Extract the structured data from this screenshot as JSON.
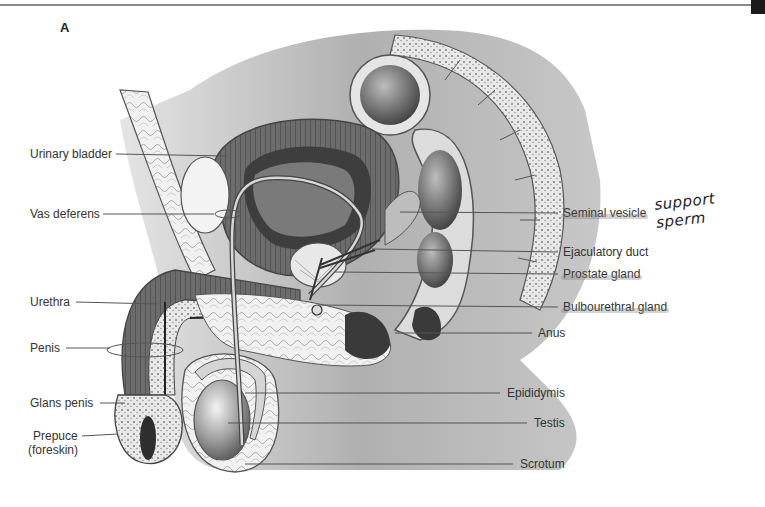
{
  "figure": {
    "panel_letter": "A",
    "left_labels": [
      {
        "id": "urinary-bladder",
        "text": "Urinary bladder",
        "x": 30,
        "y": 147
      },
      {
        "id": "vas-deferens",
        "text": "Vas deferens",
        "x": 30,
        "y": 207
      },
      {
        "id": "urethra",
        "text": "Urethra",
        "x": 30,
        "y": 295
      },
      {
        "id": "penis",
        "text": "Penis",
        "x": 30,
        "y": 342
      },
      {
        "id": "glans-penis",
        "text": "Glans penis",
        "x": 30,
        "y": 397
      },
      {
        "id": "prepuce",
        "text": "Prepuce",
        "x": 33,
        "y": 430
      },
      {
        "id": "prepuce-sub",
        "text": "(foreskin)",
        "x": 28,
        "y": 444
      }
    ],
    "right_labels": [
      {
        "id": "seminal-vesicle",
        "text": "Seminal vesicle",
        "x": 563,
        "y": 207,
        "highlighted": true
      },
      {
        "id": "ejaculatory-duct",
        "text": "Ejaculatory duct",
        "x": 563,
        "y": 246,
        "highlighted": false
      },
      {
        "id": "prostate-gland",
        "text": "Prostate gland",
        "x": 563,
        "y": 268,
        "highlighted": true
      },
      {
        "id": "bulbourethral-gland",
        "text": "Bulbourethral gland",
        "x": 563,
        "y": 301,
        "highlighted": true
      },
      {
        "id": "anus",
        "text": "Anus",
        "x": 538,
        "y": 327,
        "highlighted": false
      },
      {
        "id": "epididymis",
        "text": "Epididymis",
        "x": 507,
        "y": 386,
        "highlighted": false
      },
      {
        "id": "testis",
        "text": "Testis",
        "x": 534,
        "y": 416,
        "highlighted": false
      },
      {
        "id": "scrotum",
        "text": "Scrotum",
        "x": 520,
        "y": 458,
        "highlighted": false
      }
    ],
    "handwritten_note": {
      "text": "support sperm",
      "x": 655,
      "y": 192
    },
    "colors": {
      "line": "#555555",
      "tissue_dark": "#4a4a4a",
      "tissue_mid": "#8c8c8c",
      "tissue_light": "#d8d8d8",
      "fat": "#efefef",
      "highlight": "#a0a0a0"
    }
  }
}
